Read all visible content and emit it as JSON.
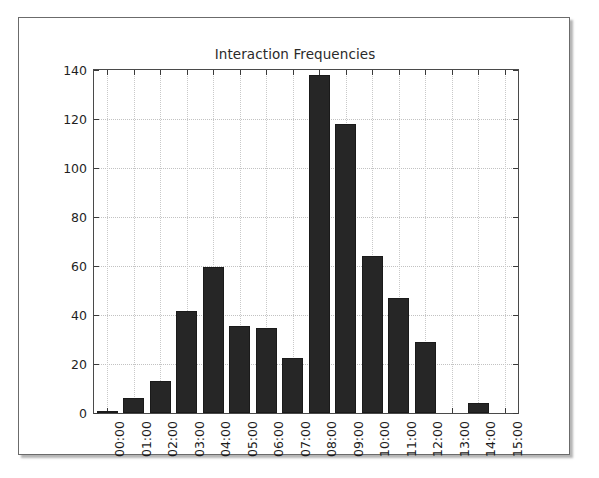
{
  "figure": {
    "frame_border_color": "#6b6b6b",
    "background_color": "#ffffff"
  },
  "chart_data": {
    "type": "bar",
    "title": "Interaction Frequencies",
    "xlabel": "",
    "ylabel": "",
    "categories": [
      "00:00",
      "01:00",
      "02:00",
      "03:00",
      "04:00",
      "05:00",
      "06:00",
      "07:00",
      "08:00",
      "09:00",
      "10:00",
      "11:00",
      "12:00",
      "13:00",
      "14:00",
      "15:00"
    ],
    "values": [
      1,
      6,
      13,
      41.5,
      59.5,
      35.5,
      34.5,
      22.5,
      138,
      118,
      64,
      47,
      29,
      0,
      4,
      0
    ],
    "ylim": [
      0,
      140
    ],
    "yticks": [
      0,
      20,
      40,
      60,
      80,
      100,
      120,
      140
    ],
    "ytick_labels": [
      "0",
      "20",
      "40",
      "60",
      "80",
      "100",
      "120",
      "140"
    ],
    "grid": true,
    "grid_style": "dotted",
    "legend": null,
    "bar_color": "#262626",
    "bar_edge_color": "#1a1a1a",
    "grid_color": "#c2c2c2",
    "axis_color": "#4a4a4a",
    "tick_label_rotation": -90
  }
}
